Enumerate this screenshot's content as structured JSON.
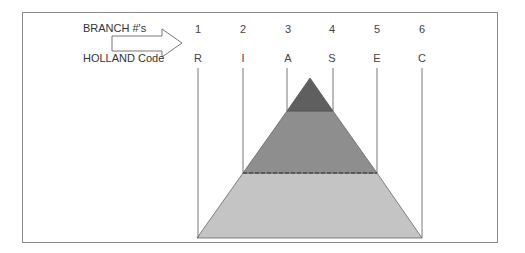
{
  "labels": {
    "branch": "BRANCH #'s",
    "holland": "HOLLAND Code"
  },
  "columns": [
    {
      "number": "1",
      "code": "R"
    },
    {
      "number": "2",
      "code": "I"
    },
    {
      "number": "3",
      "code": "A"
    },
    {
      "number": "4",
      "code": "S"
    },
    {
      "number": "5",
      "code": "E"
    },
    {
      "number": "6",
      "code": "C"
    }
  ],
  "colors": {
    "top_band": "#5f5f5f",
    "middle_band": "#8e8e8e",
    "bottom_band": "#c4c4c4",
    "lines": "#555555",
    "frame": "#8a8a8a"
  }
}
